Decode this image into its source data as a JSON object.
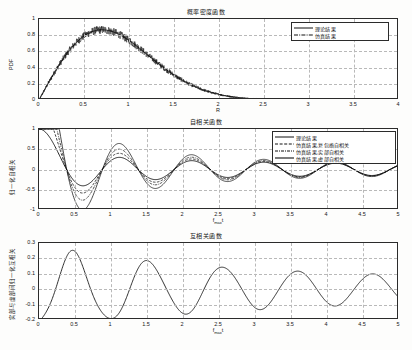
{
  "figure": {
    "background": "#fdfdfc",
    "axes_color": "#2b2b2b",
    "grid_color": "#b9b9b9",
    "line_color": "#1a1a1a"
  },
  "charts": [
    {
      "id": "pdf-chart",
      "title": "概率密度函数",
      "xlabel": "R",
      "ylabel": "PDF",
      "xlim": [
        0,
        4
      ],
      "ylim": [
        0,
        1
      ],
      "xticks": [
        "0",
        "0.5",
        "1",
        "1.5",
        "2",
        "2.5",
        "3",
        "3.5",
        "4"
      ],
      "xtick_values": [
        0,
        0.5,
        1,
        1.5,
        2,
        2.5,
        3,
        3.5,
        4
      ],
      "yticks": [
        "0",
        "0.2",
        "0.4",
        "0.6",
        "0.8",
        "1"
      ],
      "ytick_values": [
        0,
        0.2,
        0.4,
        0.6,
        0.8,
        1
      ],
      "grid": true,
      "legend_position": "top-right",
      "legend": [
        {
          "label": "理论结果",
          "style": "solid"
        },
        {
          "label": "仿真结果",
          "style": "dashdot"
        }
      ]
    },
    {
      "id": "autocorrelation-chart",
      "title": "自相关函数",
      "xlabel": "f_max·t",
      "xlabel_base": "f",
      "xlabel_sub": "max",
      "xlabel_tail": "t",
      "ylabel": "归一化自相关",
      "xlim": [
        0,
        5
      ],
      "ylim": [
        -1,
        1
      ],
      "xticks": [
        "0",
        "0.5",
        "1",
        "1.5",
        "2",
        "2.5",
        "3",
        "3.5",
        "4",
        "4.5",
        "5"
      ],
      "xtick_values": [
        0,
        0.5,
        1,
        1.5,
        2,
        2.5,
        3,
        3.5,
        4,
        4.5,
        5
      ],
      "yticks": [
        "1",
        "0.5",
        "0",
        "-0.5",
        "-1"
      ],
      "ytick_values": [
        1,
        0.5,
        0,
        -0.5,
        -1
      ],
      "grid": true,
      "legend_position": "top-right",
      "legend": [
        {
          "label": "理论结果",
          "style": "solid"
        },
        {
          "label": "仿真结果,复包络自相关",
          "style": "dashed"
        },
        {
          "label": "仿真结果,实部自相关",
          "style": "dashdot"
        },
        {
          "label": "仿真结果,虚部自相关",
          "style": "solid"
        }
      ]
    },
    {
      "id": "crosscorrelation-chart",
      "title": "互相关函数",
      "xlabel": "f_max·t",
      "xlabel_base": "f",
      "xlabel_sub": "max",
      "xlabel_tail": "t",
      "ylabel": "实部与虚部间归一化互相关",
      "xlim": [
        0,
        5
      ],
      "ylim": [
        -0.2,
        0.3
      ],
      "xticks": [
        "0",
        "0.5",
        "1",
        "1.5",
        "2",
        "2.5",
        "3",
        "3.5",
        "4",
        "4.5",
        "5"
      ],
      "xtick_values": [
        0,
        0.5,
        1,
        1.5,
        2,
        2.5,
        3,
        3.5,
        4,
        4.5,
        5
      ],
      "yticks": [
        "0.3",
        "0.2",
        "0.1",
        "0",
        "-0.1",
        "-0.2"
      ],
      "ytick_values": [
        0.3,
        0.2,
        0.1,
        0,
        -0.1,
        -0.2
      ],
      "grid": true,
      "legend_position": "none",
      "legend": []
    }
  ],
  "chart_data": [
    {
      "type": "line",
      "title": "概率密度函数",
      "xlabel": "R",
      "ylabel": "PDF",
      "xlim": [
        0,
        4
      ],
      "ylim": [
        0,
        1
      ],
      "grid": true,
      "legend_position": "top-right",
      "series": [
        {
          "name": "理论结果",
          "style": "solid",
          "comment": "Rayleigh PDF sigma≈0.70: p(r)=r/s^2*exp(-r^2/(2 s^2))",
          "x": [
            0,
            0.1,
            0.2,
            0.3,
            0.4,
            0.5,
            0.6,
            0.7,
            0.8,
            0.9,
            1.0,
            1.1,
            1.2,
            1.3,
            1.4,
            1.5,
            1.6,
            1.7,
            1.8,
            1.9,
            2.0,
            2.2,
            2.4,
            2.6,
            2.8,
            3.0,
            3.2,
            3.4,
            3.6,
            3.8,
            4.0
          ],
          "y": [
            0.0,
            0.2,
            0.38,
            0.54,
            0.67,
            0.77,
            0.83,
            0.86,
            0.86,
            0.83,
            0.78,
            0.71,
            0.63,
            0.54,
            0.45,
            0.36,
            0.28,
            0.21,
            0.16,
            0.11,
            0.08,
            0.035,
            0.014,
            0.005,
            0.0016,
            0.0005,
            0.0001,
            0.0,
            0.0,
            0.0,
            0.0
          ]
        },
        {
          "name": "仿真结果",
          "style": "dashdot",
          "comment": "noisy histogram estimate overlapping theoretical curve",
          "x": [
            0,
            0.1,
            0.2,
            0.3,
            0.4,
            0.5,
            0.6,
            0.7,
            0.8,
            0.9,
            1.0,
            1.1,
            1.2,
            1.3,
            1.4,
            1.5,
            1.6,
            1.7,
            1.8,
            1.9,
            2.0,
            2.2,
            2.4,
            2.6,
            2.8,
            3.0,
            3.2,
            3.4,
            3.6,
            3.8,
            4.0
          ],
          "y": [
            0.0,
            0.2,
            0.38,
            0.54,
            0.67,
            0.78,
            0.84,
            0.88,
            0.87,
            0.84,
            0.78,
            0.71,
            0.63,
            0.54,
            0.45,
            0.36,
            0.28,
            0.21,
            0.16,
            0.11,
            0.08,
            0.035,
            0.014,
            0.005,
            0.0016,
            0.0005,
            0.0001,
            0.0,
            0.0,
            0.0,
            0.0
          ]
        }
      ]
    },
    {
      "type": "line",
      "title": "自相关函数",
      "xlabel": "f_max·t",
      "ylabel": "归一化自相关",
      "xlim": [
        0,
        5
      ],
      "ylim": [
        -1,
        1
      ],
      "grid": true,
      "legend_position": "top-right",
      "series": [
        {
          "name": "理论结果",
          "style": "solid",
          "comment": "J0(2*pi*fm*t) Bessel autocorrelation",
          "x": [
            0,
            0.25,
            0.5,
            0.75,
            1.0,
            1.25,
            1.5,
            1.75,
            2.0,
            2.25,
            2.5,
            2.75,
            3.0,
            3.25,
            3.5,
            3.75,
            4.0,
            4.25,
            4.5,
            4.75,
            5.0
          ],
          "y": [
            1.0,
            0.4,
            -0.05,
            -0.25,
            -0.18,
            0.05,
            0.22,
            0.2,
            0.02,
            -0.15,
            -0.18,
            -0.05,
            0.12,
            0.17,
            0.06,
            -0.08,
            -0.15,
            -0.07,
            0.06,
            0.14,
            0.09
          ]
        },
        {
          "name": "仿真结果,复包络自相关",
          "style": "dashed",
          "x": [
            0,
            0.25,
            0.5,
            0.75,
            1.0,
            1.25,
            1.5,
            1.75,
            2.0,
            2.25,
            2.5,
            2.75,
            3.0,
            3.25,
            3.5,
            3.75,
            4.0,
            4.25,
            4.5,
            4.75,
            5.0
          ],
          "y": [
            1.0,
            0.25,
            -0.3,
            -0.38,
            -0.1,
            0.22,
            0.32,
            0.18,
            -0.08,
            -0.3,
            -0.28,
            -0.02,
            0.28,
            0.3,
            0.05,
            -0.22,
            -0.3,
            -0.1,
            0.2,
            0.28,
            0.12
          ]
        },
        {
          "name": "仿真结果,实部自相关",
          "style": "dashdot",
          "x": [
            0,
            0.25,
            0.5,
            0.75,
            1.0,
            1.25,
            1.5,
            1.75,
            2.0,
            2.25,
            2.5,
            2.75,
            3.0,
            3.25,
            3.5,
            3.75,
            4.0,
            4.25,
            4.5,
            4.75,
            5.0
          ],
          "y": [
            1.0,
            0.18,
            -0.48,
            -0.52,
            -0.12,
            0.26,
            0.33,
            0.13,
            -0.18,
            -0.36,
            -0.3,
            0.02,
            0.33,
            0.32,
            0.02,
            -0.27,
            -0.33,
            -0.09,
            0.24,
            0.3,
            0.1
          ]
        },
        {
          "name": "仿真结果,虚部自相关",
          "style": "solid",
          "x": [
            0,
            0.25,
            0.5,
            0.75,
            1.0,
            1.25,
            1.5,
            1.75,
            2.0,
            2.25,
            2.5,
            2.75,
            3.0,
            3.25,
            3.5,
            3.75,
            4.0,
            4.25,
            4.5,
            4.75,
            5.0
          ],
          "y": [
            1.0,
            0.08,
            -0.7,
            -0.72,
            -0.2,
            0.28,
            0.31,
            0.08,
            -0.26,
            -0.4,
            -0.3,
            0.05,
            0.35,
            0.3,
            -0.02,
            -0.3,
            -0.33,
            -0.06,
            0.26,
            0.3,
            0.08
          ]
        }
      ]
    },
    {
      "type": "line",
      "title": "互相关函数",
      "xlabel": "f_max·t",
      "ylabel": "实部与虚部间归一化互相关",
      "xlim": [
        0,
        5
      ],
      "ylim": [
        -0.2,
        0.3
      ],
      "grid": true,
      "legend_position": "none",
      "series": [
        {
          "name": "实部与虚部间归一化互相关",
          "style": "solid",
          "x": [
            0,
            0.2,
            0.45,
            0.5,
            0.75,
            1.05,
            1.3,
            1.6,
            1.65,
            1.9,
            2.15,
            2.4,
            2.65,
            2.9,
            3.15,
            3.4,
            3.65,
            3.9,
            4.15,
            4.4,
            4.65,
            4.9,
            5.0
          ],
          "y": [
            0.02,
            -0.05,
            -0.195,
            -0.2,
            -0.06,
            0.25,
            0.1,
            -0.13,
            -0.135,
            0.0,
            0.115,
            0.0,
            -0.09,
            0.0,
            0.055,
            -0.02,
            -0.07,
            0.0,
            0.055,
            -0.01,
            -0.07,
            0.0,
            0.015
          ]
        }
      ]
    }
  ]
}
